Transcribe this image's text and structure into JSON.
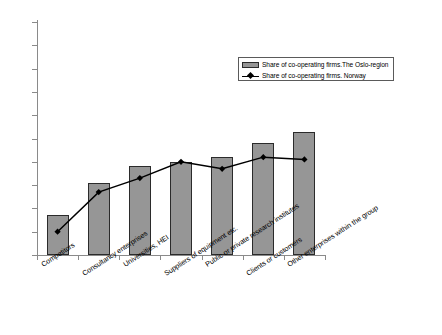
{
  "chart_data": {
    "type": "bar",
    "title": "",
    "subtitle": "",
    "xlabel": "",
    "ylabel": "",
    "ylim": [
      0,
      100
    ],
    "ytick_labels": [
      "0%",
      "10%",
      "20%",
      "30%",
      "40%",
      "50%",
      "60%",
      "70%",
      "80%",
      "90%",
      "100%"
    ],
    "ytick_values": [
      0,
      10,
      20,
      30,
      40,
      50,
      60,
      70,
      80,
      90,
      100
    ],
    "grid": false,
    "legend_position": "upper-right-inside",
    "categories": [
      "Competitors",
      "Consultancy enterprises",
      "Universities, HEI",
      "Suppliers of equipment etc.",
      "Public or private research institutes",
      "Clients or customers",
      "Other enterprises within the group"
    ],
    "series": [
      {
        "name": "Share of co-operating firms.The Oslo-region",
        "type": "bar",
        "color": "#969696",
        "edge_color": "#2b2b2b",
        "values": [
          17,
          31,
          38,
          40,
          42,
          48,
          53
        ]
      },
      {
        "name": "Share of co-operating firms. Norway",
        "type": "line",
        "color": "#000000",
        "marker": "diamond",
        "values": [
          10,
          27,
          33,
          40,
          37,
          42,
          41
        ]
      }
    ]
  },
  "legend": {
    "items": [
      {
        "label": "Share of co-operating firms.The Oslo-region",
        "swatch": "bar-swatch"
      },
      {
        "label": "Share of co-operating firms. Norway",
        "swatch": "line-marker-swatch"
      }
    ]
  }
}
